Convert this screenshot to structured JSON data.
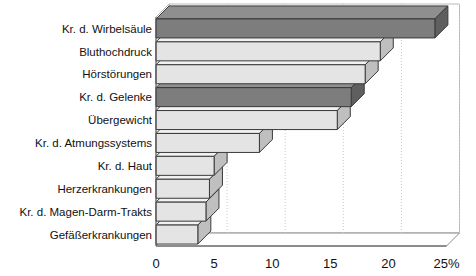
{
  "chart_data": {
    "type": "bar",
    "orientation": "horizontal",
    "title": "",
    "subtitle": "",
    "xlabel": "",
    "ylabel": "",
    "xlim": [
      0,
      25
    ],
    "ylim": null,
    "grid": true,
    "grid_axis": "x",
    "legend": null,
    "legend_position": "none",
    "unit": "%",
    "axis_suffix_label": "25%",
    "categories": [
      "Kr. d. Wirbelsäule",
      "Bluthochdruck",
      "Hörstörungen",
      "Kr. d. Gelenke",
      "Übergewicht",
      "Kr. d. Atmungssystems",
      "Kr. d. Haut",
      "Herzerkrankungen",
      "Kr. d. Magen-Darm-Trakts",
      "Gefäßerkrankungen"
    ],
    "values": [
      24.0,
      19.3,
      18.0,
      16.8,
      15.6,
      8.9,
      5.0,
      4.6,
      4.3,
      3.6
    ],
    "bar_styles": [
      "dark",
      "light",
      "light",
      "dark",
      "light",
      "light",
      "light",
      "light",
      "light",
      "light"
    ],
    "xticks": [
      0,
      5,
      10,
      15,
      20,
      25
    ],
    "xtick_labels": [
      "0",
      "5",
      "10",
      "15",
      "20",
      "25%"
    ]
  },
  "colors": {
    "bar_dark": "#7d7d7d",
    "bar_dark_top": "#8f8f8f",
    "bar_dark_side": "#5f5f5f",
    "bar_light": "#e4e4e4",
    "bar_light_top": "#f2f2f2",
    "bar_light_side": "#bfbfbf",
    "outline": "#3a3a3a",
    "grid": "#c9c9c9",
    "axis": "#555555",
    "wall": "#b9b9b9",
    "background": "#ffffff",
    "text": "#111111"
  }
}
